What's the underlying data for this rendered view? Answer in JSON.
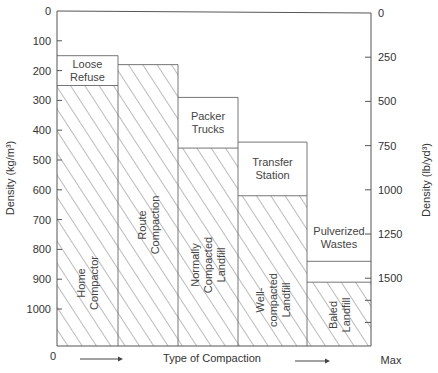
{
  "chart_data": {
    "type": "bar",
    "title": "",
    "xlabel": "Type of Compaction",
    "x_start_label": "0",
    "x_end_label": "Max",
    "ylabel_left": "Density (kg/m³)",
    "ylabel_right": "Density (lb/yd³)",
    "ylim_left": [
      0,
      1120
    ],
    "y_inverted": true,
    "left_ticks": [
      0,
      100,
      200,
      300,
      400,
      500,
      600,
      700,
      800,
      900,
      1000
    ],
    "right_ticks": [
      0,
      250,
      500,
      750,
      1000,
      1250,
      1500
    ],
    "right_axis_conversion_kg_per_m3_per_lb_per_yd3": 0.5933,
    "grid": false,
    "columns": [
      {
        "name": "col-1",
        "upper_box": {
          "label": [
            "Loose",
            "Refuse"
          ],
          "from": 150,
          "to": 250
        },
        "hatched": {
          "label": [
            "Home",
            "Compactor"
          ],
          "from": 250,
          "orientation": "vertical"
        }
      },
      {
        "name": "col-2",
        "upper_box": null,
        "hatched": {
          "label": [
            "Route",
            "Compaction"
          ],
          "from": 180,
          "orientation": "vertical"
        }
      },
      {
        "name": "col-3",
        "upper_box": {
          "label": [
            "Packer",
            "Trucks"
          ],
          "from": 290,
          "to": 460
        },
        "hatched": {
          "label": [
            "Normally",
            "Compacted",
            "Landfill"
          ],
          "from": 460,
          "orientation": "vertical"
        }
      },
      {
        "name": "col-4",
        "upper_box": {
          "label": [
            "Transfer",
            "Station"
          ],
          "from": 440,
          "to": 620
        },
        "hatched": {
          "label": [
            "Well-",
            "compacted",
            "Landfill"
          ],
          "from": 620,
          "orientation": "vertical"
        }
      },
      {
        "name": "col-5",
        "upper_box": {
          "label": [
            "Pulverized",
            "Wastes"
          ],
          "from": 840,
          "to": 910,
          "label_above": true
        },
        "hatched": {
          "label": [
            "Baled",
            "Landfill"
          ],
          "from": 910,
          "orientation": "vertical"
        }
      }
    ]
  }
}
